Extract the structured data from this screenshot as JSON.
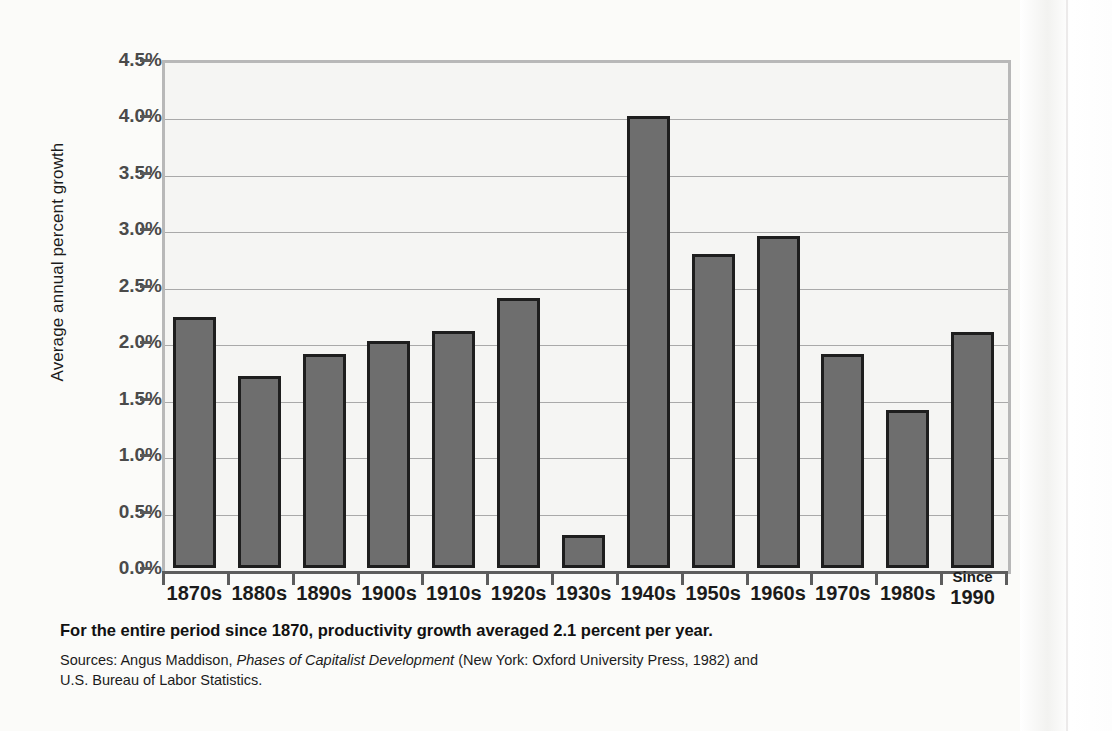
{
  "chart_data": {
    "type": "bar",
    "title": "",
    "xlabel": "",
    "ylabel": "Average annual percent growth",
    "ylim": [
      0,
      4.5
    ],
    "ytick_values": [
      0.0,
      0.5,
      1.0,
      1.5,
      2.0,
      2.5,
      3.0,
      3.5,
      4.0,
      4.5
    ],
    "ytick_labels": [
      "0.0%",
      "0.5%",
      "1.0%",
      "1.5%",
      "2.0%",
      "2.5%",
      "3.0%",
      "3.5%",
      "4.0%",
      "4.5%"
    ],
    "grid": true,
    "legend": "none",
    "categories": [
      "1870s",
      "1880s",
      "1890s",
      "1900s",
      "1910s",
      "1920s",
      "1930s",
      "1940s",
      "1950s",
      "1960s",
      "1970s",
      "1980s",
      "Since 1990"
    ],
    "values": [
      2.22,
      1.7,
      1.9,
      2.01,
      2.1,
      2.39,
      0.29,
      4.0,
      2.78,
      2.94,
      1.9,
      1.4,
      2.09
    ],
    "bar_color": "#6e6e6e",
    "bar_edge_color": "#1e1e1e",
    "plot_background": "#f5f5f3",
    "gridline_color": "#a9a9a9",
    "axis_color": "#5d5d5d"
  },
  "xtick_labels": [
    {
      "line1": "1870s",
      "line2": ""
    },
    {
      "line1": "1880s",
      "line2": ""
    },
    {
      "line1": "1890s",
      "line2": ""
    },
    {
      "line1": "1900s",
      "line2": ""
    },
    {
      "line1": "1910s",
      "line2": ""
    },
    {
      "line1": "1920s",
      "line2": ""
    },
    {
      "line1": "1930s",
      "line2": ""
    },
    {
      "line1": "1940s",
      "line2": ""
    },
    {
      "line1": "1950s",
      "line2": ""
    },
    {
      "line1": "1960s",
      "line2": ""
    },
    {
      "line1": "1970s",
      "line2": ""
    },
    {
      "line1": "1980s",
      "line2": ""
    },
    {
      "line1": "Since",
      "line2": "1990"
    }
  ],
  "caption": {
    "main": "For the entire period since 1870, productivity growth averaged 2.1 percent per year.",
    "sources_prefix": "Sources: Angus Maddison, ",
    "sources_italic": "Phases of Capitalist Development",
    "sources_suffix": " (New York: Oxford University Press, 1982) and U.S. Bureau of Labor Statistics."
  }
}
